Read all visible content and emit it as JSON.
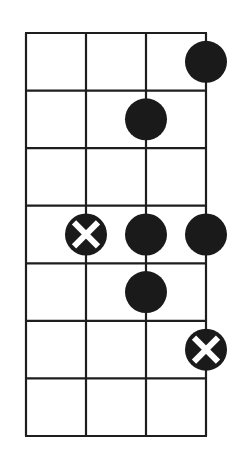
{
  "diagram": {
    "type": "fretboard-scale-diagram",
    "strings": 4,
    "frets": 7,
    "colors": {
      "line": "#1e1e1e",
      "dot": "#1a1a1a",
      "background": "#ffffff",
      "x_mark": "#ffffff"
    },
    "grid": {
      "left": 26,
      "top": 33,
      "col_width": 60,
      "row_height": 57.57
    },
    "markers": [
      {
        "string": 4,
        "fret": 1,
        "kind": "dot"
      },
      {
        "string": 3,
        "fret": 2,
        "kind": "dot"
      },
      {
        "string": 2,
        "fret": 4,
        "kind": "root-x"
      },
      {
        "string": 3,
        "fret": 4,
        "kind": "dot"
      },
      {
        "string": 4,
        "fret": 4,
        "kind": "dot"
      },
      {
        "string": 3,
        "fret": 5,
        "kind": "dot"
      },
      {
        "string": 4,
        "fret": 6,
        "kind": "root-x"
      }
    ]
  }
}
